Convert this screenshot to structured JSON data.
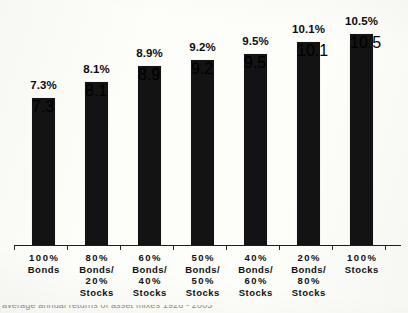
{
  "chart_data": {
    "type": "bar",
    "title": "",
    "subtitle": "",
    "xlabel": "",
    "ylabel": "",
    "grid": false,
    "legend": "none",
    "ylim": [
      0,
      11.6
    ],
    "categories": [
      "100% Bonds",
      "80% Bonds/ 20% Stocks",
      "60% Bonds/ 40% Stocks",
      "50% Bonds/ 50% Stocks",
      "40% Bonds/ 60% Stocks",
      "20% Bonds/ 80% Stocks",
      "100% Stocks"
    ],
    "values": [
      7.3,
      8.1,
      8.9,
      9.2,
      9.5,
      10.1,
      10.5
    ],
    "value_labels": [
      "7.3%",
      "8.1%",
      "8.9%",
      "9.2%",
      "9.5%",
      "10.1%",
      "10.5%"
    ],
    "bar_color": "#131313",
    "background_color": "#fdfdfa",
    "axis_color": "#1d1d1d"
  },
  "category_label_lines": [
    [
      "100%",
      "Bonds"
    ],
    [
      "80%",
      "Bonds/",
      "20%",
      "Stocks"
    ],
    [
      "60%",
      "Bonds/",
      "40%",
      "Stocks"
    ],
    [
      "50%",
      "Bonds/",
      "50%",
      "Stocks"
    ],
    [
      "40%",
      "Bonds/",
      "60%",
      "Stocks"
    ],
    [
      "20%",
      "Bonds/",
      "80%",
      "Stocks"
    ],
    [
      "100%",
      "Stocks"
    ]
  ],
  "footer": {
    "clipped_text": "average annual returns of asset mixes 1926 - 2005"
  }
}
